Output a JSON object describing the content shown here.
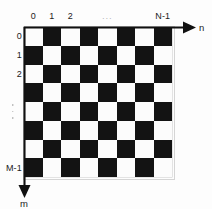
{
  "diagram": {
    "type": "indexed-checkerboard-grid",
    "background_color": "#ffffff",
    "dark_cell_color": "#131313",
    "light_cell_color": "#fcfcfc",
    "ink_color": "#111111"
  },
  "board": {
    "rows": 8,
    "cols": 8,
    "first_cell_shade": "light",
    "left_px": 24,
    "top_px": 27,
    "width_px": 148,
    "height_px": 150,
    "cell_size_px": 18.5,
    "pattern": [
      [
        "light",
        "dark",
        "light",
        "dark",
        "light",
        "dark",
        "light",
        "dark"
      ],
      [
        "dark",
        "light",
        "dark",
        "light",
        "dark",
        "light",
        "dark",
        "light"
      ],
      [
        "light",
        "dark",
        "light",
        "dark",
        "light",
        "dark",
        "light",
        "dark"
      ],
      [
        "dark",
        "light",
        "dark",
        "light",
        "dark",
        "light",
        "dark",
        "light"
      ],
      [
        "light",
        "dark",
        "light",
        "dark",
        "light",
        "dark",
        "light",
        "dark"
      ],
      [
        "dark",
        "light",
        "dark",
        "light",
        "dark",
        "light",
        "dark",
        "light"
      ],
      [
        "light",
        "dark",
        "light",
        "dark",
        "light",
        "dark",
        "light",
        "dark"
      ],
      [
        "dark",
        "light",
        "dark",
        "light",
        "dark",
        "light",
        "dark",
        "light"
      ]
    ]
  },
  "column_axis": {
    "name": "n",
    "labels": [
      {
        "text": "0",
        "col_index": 0
      },
      {
        "text": "1",
        "col_index": 1
      },
      {
        "text": "2",
        "col_index": 2
      },
      {
        "text": "N-1",
        "col_index": 7
      }
    ],
    "ellipsis": "···",
    "ellipsis_col_index": 4,
    "arrow_direction": "right"
  },
  "row_axis": {
    "name": "m",
    "labels": [
      {
        "text": "0",
        "row_index": 0
      },
      {
        "text": "1",
        "row_index": 1
      },
      {
        "text": "2",
        "row_index": 2
      },
      {
        "text": "M-1",
        "row_index": 7
      }
    ],
    "ellipsis_dots": 3,
    "ellipsis_row_index": 4,
    "arrow_direction": "down"
  }
}
